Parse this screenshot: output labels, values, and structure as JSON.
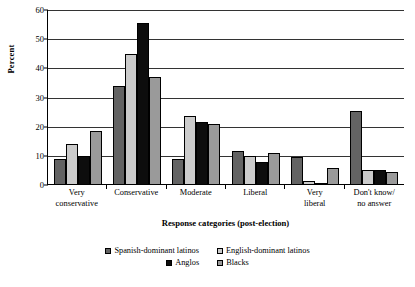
{
  "chart_data": {
    "type": "bar",
    "title": "",
    "xlabel": "Response categories (post-election)",
    "ylabel": "Percent",
    "ylim": [
      0,
      60
    ],
    "yticks": [
      0,
      10,
      20,
      30,
      40,
      50,
      60
    ],
    "grid": true,
    "legend_position": "bottom",
    "categories": [
      "Very\nconservative",
      "Conservative",
      "Moderate",
      "Liberal",
      "Very\nliberal",
      "Don't know/\nno answer"
    ],
    "category_lines": [
      [
        "Very",
        "conservative"
      ],
      [
        "Conservative",
        ""
      ],
      [
        "Moderate",
        ""
      ],
      [
        "Liberal",
        ""
      ],
      [
        "Very",
        "liberal"
      ],
      [
        "Don't know/",
        "no answer"
      ]
    ],
    "series": [
      {
        "name": "Spanish-dominant latinos",
        "color": "#636363",
        "values": [
          9,
          34,
          9,
          11.5,
          9.5,
          25.5
        ]
      },
      {
        "name": "English-dominant latinos",
        "color": "#cbcbcb",
        "values": [
          14,
          45,
          23.5,
          10,
          1.5,
          5
        ]
      },
      {
        "name": "Anglos",
        "color": "#0d0d0d",
        "values": [
          10,
          55.5,
          21.5,
          8,
          0.3,
          5
        ]
      },
      {
        "name": "Blacks",
        "color": "#9a9a9a",
        "values": [
          18.5,
          37,
          21,
          11,
          6,
          4.5
        ]
      }
    ]
  }
}
